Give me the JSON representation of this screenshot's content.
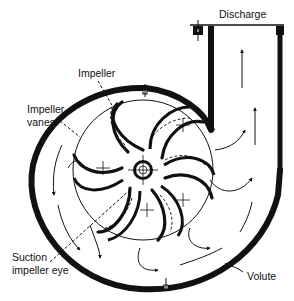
{
  "figure": {
    "colors": {
      "line": "#111111",
      "background": "#ffffff"
    }
  },
  "labels": {
    "discharge": "Discharge",
    "impeller": "Impeller",
    "impeller_vanes_line1": "Impeller",
    "impeller_vanes_line2": "vanes",
    "suction_eye_line1": "Suction",
    "suction_eye_line2": "impeller eye",
    "volute": "Volute"
  },
  "components": [
    {
      "name": "discharge",
      "label": "Discharge"
    },
    {
      "name": "impeller",
      "label": "Impeller"
    },
    {
      "name": "impeller-vanes",
      "label": "Impeller vanes"
    },
    {
      "name": "suction-impeller-eye",
      "label": "Suction impeller eye"
    },
    {
      "name": "volute",
      "label": "Volute"
    }
  ]
}
